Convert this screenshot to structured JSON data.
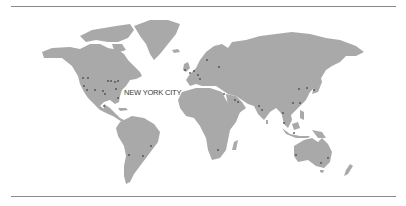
{
  "map": {
    "type": "world-map",
    "land_color": "#a9a9a9",
    "dot_color": "#4a4a4a",
    "rule_color": "#8a8a8a",
    "highlight_label": "NEW YORK CITY",
    "city_markers": [
      {
        "region": "North America",
        "x": 83,
        "y": 78
      },
      {
        "region": "North America",
        "x": 88,
        "y": 78
      },
      {
        "region": "North America",
        "x": 84,
        "y": 86
      },
      {
        "region": "North America",
        "x": 87,
        "y": 90
      },
      {
        "region": "North America",
        "x": 95,
        "y": 90
      },
      {
        "region": "North America",
        "x": 103,
        "y": 91
      },
      {
        "region": "North America",
        "x": 105,
        "y": 94
      },
      {
        "region": "North America",
        "x": 108,
        "y": 81
      },
      {
        "region": "North America",
        "x": 111,
        "y": 81
      },
      {
        "region": "North America",
        "x": 115,
        "y": 82
      },
      {
        "region": "North America",
        "x": 118,
        "y": 81
      },
      {
        "region": "North America",
        "x": 116,
        "y": 89
      },
      {
        "region": "North America",
        "x": 118,
        "y": 98
      },
      {
        "region": "North America",
        "x": 104,
        "y": 106
      },
      {
        "region": "South America",
        "x": 151,
        "y": 146
      },
      {
        "region": "South America",
        "x": 143,
        "y": 156
      },
      {
        "region": "South America",
        "x": 129,
        "y": 155
      },
      {
        "region": "Europe",
        "x": 185,
        "y": 70
      },
      {
        "region": "Europe",
        "x": 190,
        "y": 73
      },
      {
        "region": "Europe",
        "x": 194,
        "y": 71
      },
      {
        "region": "Europe",
        "x": 198,
        "y": 75
      },
      {
        "region": "Europe",
        "x": 200,
        "y": 79
      },
      {
        "region": "Europe",
        "x": 207,
        "y": 60
      },
      {
        "region": "Europe",
        "x": 219,
        "y": 67
      },
      {
        "region": "Middle East",
        "x": 224,
        "y": 94
      },
      {
        "region": "Middle East",
        "x": 235,
        "y": 100
      },
      {
        "region": "Middle East",
        "x": 238,
        "y": 102
      },
      {
        "region": "Africa",
        "x": 218,
        "y": 150
      },
      {
        "region": "Asia",
        "x": 259,
        "y": 106
      },
      {
        "region": "Asia",
        "x": 262,
        "y": 110
      },
      {
        "region": "Asia",
        "x": 283,
        "y": 113
      },
      {
        "region": "Asia",
        "x": 284,
        "y": 123
      },
      {
        "region": "Asia",
        "x": 293,
        "y": 103
      },
      {
        "region": "Asia",
        "x": 300,
        "y": 103
      },
      {
        "region": "Asia",
        "x": 299,
        "y": 89
      },
      {
        "region": "Asia",
        "x": 307,
        "y": 88
      },
      {
        "region": "Asia",
        "x": 314,
        "y": 90
      },
      {
        "region": "Asia",
        "x": 294,
        "y": 133
      },
      {
        "region": "Oceania",
        "x": 296,
        "y": 155
      },
      {
        "region": "Oceania",
        "x": 321,
        "y": 163
      },
      {
        "region": "Oceania",
        "x": 328,
        "y": 158
      }
    ]
  }
}
